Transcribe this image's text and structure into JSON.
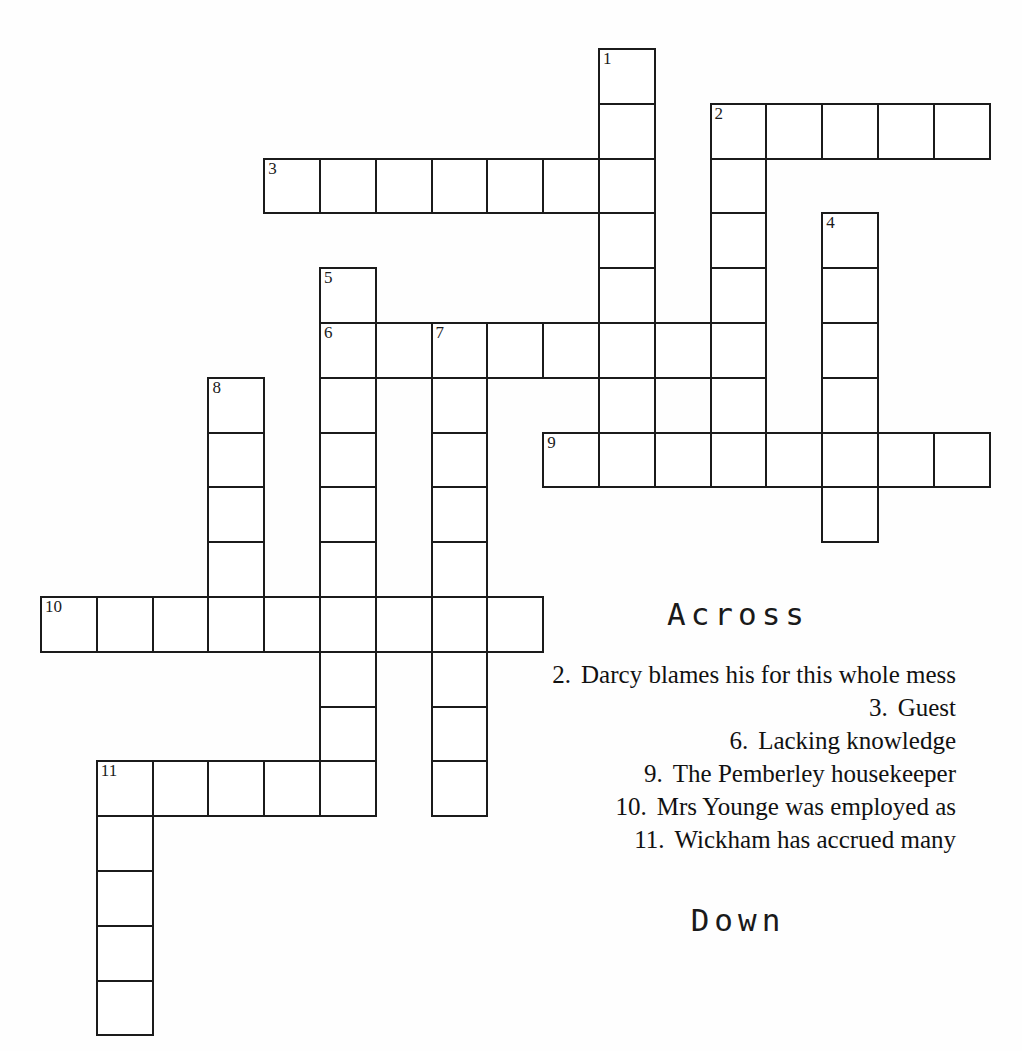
{
  "puzzle": {
    "title": "Crossword Puzzle",
    "cell_size": 55.8,
    "row_height": 54.8,
    "origin_x": 40,
    "origin_y": 48,
    "ink_color": "#1b1b1b",
    "paper_color": "#ffffff"
  },
  "headings": {
    "across": "Across",
    "down": "Down"
  },
  "entries": [
    {
      "number": "1",
      "direction": "down",
      "col": 10,
      "row": 0,
      "length": 7
    },
    {
      "number": "2",
      "direction": "across",
      "col": 12,
      "row": 1,
      "length": 5
    },
    {
      "number": "2",
      "direction": "down",
      "col": 12,
      "row": 1,
      "length": 7
    },
    {
      "number": "3",
      "direction": "across",
      "col": 4,
      "row": 2,
      "length": 7
    },
    {
      "number": "4",
      "direction": "down",
      "col": 14,
      "row": 3,
      "length": 6
    },
    {
      "number": "5",
      "direction": "down",
      "col": 5,
      "row": 4,
      "length": 9
    },
    {
      "number": "6",
      "direction": "across",
      "col": 5,
      "row": 5,
      "length": 8
    },
    {
      "number": "7",
      "direction": "down",
      "col": 7,
      "row": 5,
      "length": 9
    },
    {
      "number": "8",
      "direction": "down",
      "col": 3,
      "row": 6,
      "length": 5
    },
    {
      "number": "9",
      "direction": "across",
      "col": 9,
      "row": 7,
      "length": 8
    },
    {
      "number": "10",
      "direction": "across",
      "col": 0,
      "row": 10,
      "length": 9
    },
    {
      "number": "11",
      "direction": "across",
      "col": 1,
      "row": 13,
      "length": 5
    },
    {
      "number": "11",
      "direction": "down",
      "col": 1,
      "row": 13,
      "length": 5
    }
  ],
  "numbered_cells": [
    {
      "number": "1",
      "col": 10,
      "row": 0
    },
    {
      "number": "2",
      "col": 12,
      "row": 1
    },
    {
      "number": "3",
      "col": 4,
      "row": 2
    },
    {
      "number": "4",
      "col": 14,
      "row": 3
    },
    {
      "number": "5",
      "col": 5,
      "row": 4
    },
    {
      "number": "6",
      "col": 5,
      "row": 5
    },
    {
      "number": "7",
      "col": 7,
      "row": 5
    },
    {
      "number": "8",
      "col": 3,
      "row": 6
    },
    {
      "number": "9",
      "col": 9,
      "row": 7
    },
    {
      "number": "10",
      "col": 0,
      "row": 10
    },
    {
      "number": "11",
      "col": 1,
      "row": 13
    }
  ],
  "across_clues": [
    {
      "number": "2.",
      "text": "Darcy blames his for this whole mess"
    },
    {
      "number": "3.",
      "text": "Guest"
    },
    {
      "number": "6.",
      "text": "Lacking knowledge"
    },
    {
      "number": "9.",
      "text": "The Pemberley housekeeper"
    },
    {
      "number": "10.",
      "text": "Mrs Younge was employed as"
    },
    {
      "number": "11.",
      "text": "Wickham has accrued many"
    }
  ],
  "down_clues": []
}
